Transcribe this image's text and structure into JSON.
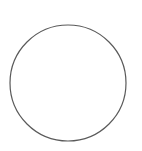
{
  "diagram": {
    "background": "#ffffff",
    "shapes": [
      {
        "type": "circle",
        "cx": 68,
        "cy": 83,
        "r": 58,
        "stroke": "#5a5a5a",
        "stroke_width": 1.2,
        "fill": "none"
      }
    ]
  }
}
